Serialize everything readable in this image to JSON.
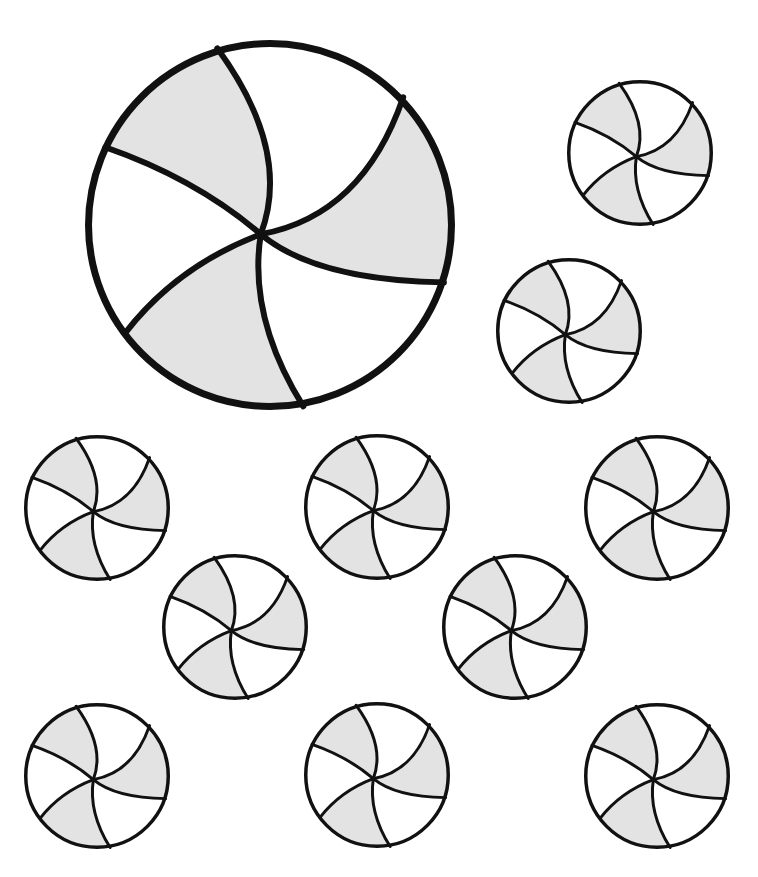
{
  "page": {
    "title": "Peppermint candies coloring page",
    "background": "#ffffff",
    "stroke_color": "#111111",
    "fill_light": "#e3e3e3",
    "fill_white": "#ffffff"
  },
  "candies": [
    {
      "id": "large",
      "cx": 270,
      "cy": 225,
      "r": 185,
      "stroke": 7
    },
    {
      "id": "small-1",
      "cx": 640,
      "cy": 153,
      "r": 73,
      "stroke": 3.5
    },
    {
      "id": "small-2",
      "cx": 569,
      "cy": 331,
      "r": 73,
      "stroke": 3.5
    },
    {
      "id": "small-3",
      "cx": 97,
      "cy": 508,
      "r": 73,
      "stroke": 3.5
    },
    {
      "id": "small-4",
      "cx": 377,
      "cy": 507,
      "r": 73,
      "stroke": 3.5
    },
    {
      "id": "small-5",
      "cx": 657,
      "cy": 508,
      "r": 73,
      "stroke": 3.5
    },
    {
      "id": "small-6",
      "cx": 235,
      "cy": 627,
      "r": 73,
      "stroke": 3.5
    },
    {
      "id": "small-7",
      "cx": 515,
      "cy": 627,
      "r": 73,
      "stroke": 3.5
    },
    {
      "id": "small-8",
      "cx": 97,
      "cy": 776,
      "r": 73,
      "stroke": 3.5
    },
    {
      "id": "small-9",
      "cx": 377,
      "cy": 775,
      "r": 73,
      "stroke": 3.5
    },
    {
      "id": "small-10",
      "cx": 657,
      "cy": 776,
      "r": 73,
      "stroke": 3.5
    }
  ]
}
